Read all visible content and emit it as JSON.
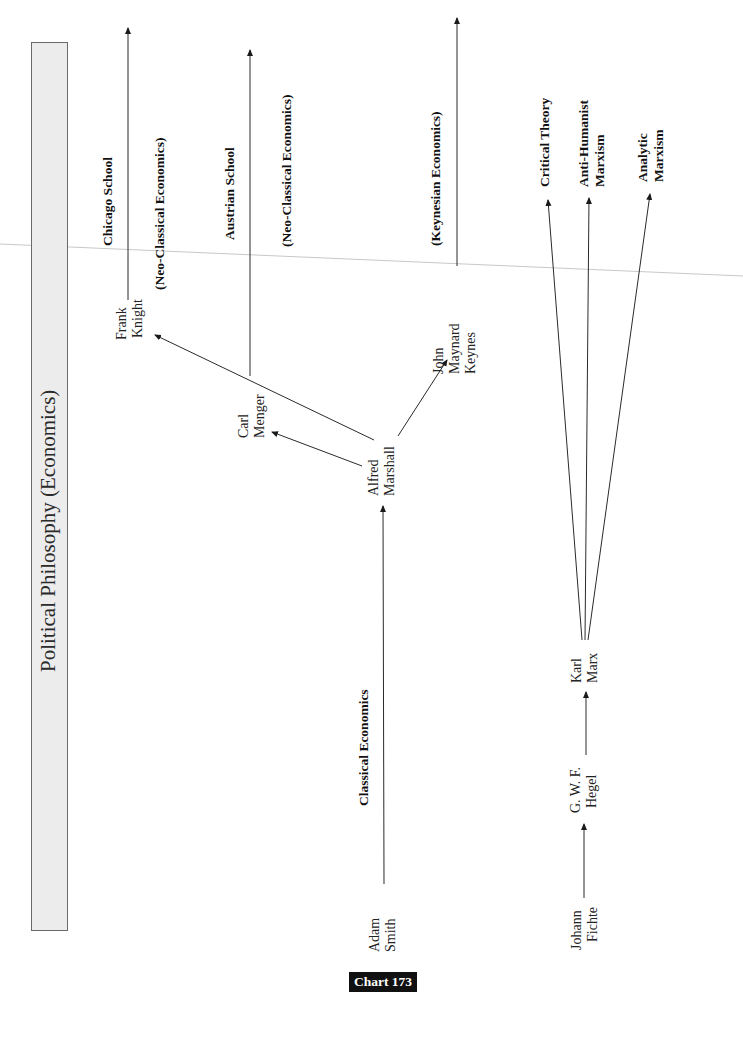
{
  "title": "Political Philosophy (Economics)",
  "chart_label": "Chart 173",
  "colors": {
    "line": "#2a2a2a",
    "title_box_fill": "#ececec",
    "title_box_border": "#6a6a6a",
    "chart_tag_bg": "#111111",
    "chart_tag_text": "#ffffff",
    "scan_line": "#c8c8c8"
  },
  "nodes": {
    "adam_smith": [
      "Adam",
      "Smith"
    ],
    "alfred_marshall": [
      "Alfred",
      "Marshall"
    ],
    "carl_menger": [
      "Carl",
      "Menger"
    ],
    "frank_knight": [
      "Frank",
      "Knight"
    ],
    "john_maynard_keynes": [
      "John",
      "Maynard",
      "Keynes"
    ],
    "johann_fichte": [
      "Johann",
      "Fichte"
    ],
    "gwf_hegel": [
      "G. W. F.",
      "Hegel"
    ],
    "karl_marx": [
      "Karl",
      "Marx"
    ]
  },
  "schools": {
    "classical": "Classical Economics",
    "chicago": "Chicago School",
    "chicago_sub": "(Neo-Classical Economics)",
    "austrian": "Austrian School",
    "austrian_sub": "(Neo-Classical Economics)",
    "keynesian": "(Keynesian Economics)",
    "critical_theory": "Critical Theory",
    "anti_humanist": [
      "Anti-Humanist",
      "Marxism"
    ],
    "analytic": [
      "Analytic",
      "Marxism"
    ]
  },
  "edges": [
    {
      "from": "Adam Smith",
      "to": "Alfred Marshall",
      "label": "Classical Economics"
    },
    {
      "from": "Alfred Marshall",
      "to": "Carl Menger"
    },
    {
      "from": "Alfred Marshall",
      "to": "Frank Knight"
    },
    {
      "from": "Alfred Marshall",
      "to": "John Maynard Keynes"
    },
    {
      "from": "Frank Knight",
      "to": "Chicago School (Neo-Classical Economics)"
    },
    {
      "from": "Carl Menger",
      "to": "Austrian School (Neo-Classical Economics)"
    },
    {
      "from": "John Maynard Keynes",
      "to": "(Keynesian Economics)"
    },
    {
      "from": "Johann Fichte",
      "to": "G. W. F. Hegel"
    },
    {
      "from": "G. W. F. Hegel",
      "to": "Karl Marx"
    },
    {
      "from": "Karl Marx",
      "to": "Critical Theory"
    },
    {
      "from": "Karl Marx",
      "to": "Anti-Humanist Marxism"
    },
    {
      "from": "Karl Marx",
      "to": "Analytic Marxism"
    }
  ]
}
